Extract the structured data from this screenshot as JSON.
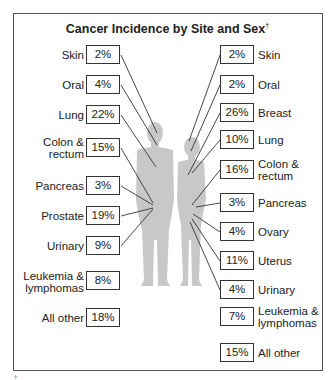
{
  "title": "Cancer Incidence by Site and Sex",
  "title_footnote_mark": "†",
  "colors": {
    "silhouette": "#c8c8c8",
    "lines": "#333333",
    "box_border": "#333333"
  },
  "male": {
    "items": [
      {
        "site": "Skin",
        "pct": "2%"
      },
      {
        "site": "Oral",
        "pct": "4%"
      },
      {
        "site": "Lung",
        "pct": "22%"
      },
      {
        "site": "Colon &",
        "site2": "rectum",
        "pct": "15%"
      },
      {
        "site": "Pancreas",
        "pct": "3%"
      },
      {
        "site": "Prostate",
        "pct": "19%"
      },
      {
        "site": "Urinary",
        "pct": "9%"
      },
      {
        "site": "Leukemia &",
        "site2": "lymphomas",
        "pct": "8%"
      },
      {
        "site": "All other",
        "pct": "18%"
      }
    ]
  },
  "female": {
    "items": [
      {
        "site": "Skin",
        "pct": "2%"
      },
      {
        "site": "Oral",
        "pct": "2%"
      },
      {
        "site": "Breast",
        "pct": "26%"
      },
      {
        "site": "Lung",
        "pct": "10%"
      },
      {
        "site": "Colon &",
        "site2": "rectum",
        "pct": "16%"
      },
      {
        "site": "Pancreas",
        "pct": "3%"
      },
      {
        "site": "Ovary",
        "pct": "4%"
      },
      {
        "site": "Uterus",
        "pct": "11%"
      },
      {
        "site": "Urinary",
        "pct": "4%"
      },
      {
        "site": "Leukemia &",
        "site2": "lymphomas",
        "pct": "7%"
      },
      {
        "site": "All other",
        "pct": "15%"
      }
    ]
  },
  "footnote": "†"
}
